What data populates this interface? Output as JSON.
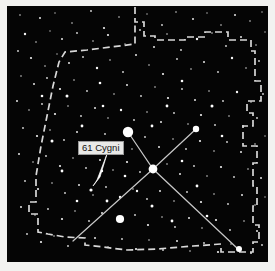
{
  "figure": {
    "caption": "",
    "background_color": "#f2f2f0",
    "sky_color": "#050505",
    "star_color": "#ffffff",
    "boundary_color": "#d8d8d8",
    "constellation_line_color": "#c8c8c8",
    "label_text_color": "#121212",
    "label_background_color": "#e9e9e7"
  },
  "labels": [
    {
      "id": "61-cygni",
      "text": "61 Cygni",
      "x": 71,
      "y": 135,
      "arrow": {
        "from_x": 100,
        "from_y": 148,
        "to_x": 86,
        "to_y": 180
      }
    }
  ],
  "chart_data": {
    "type": "scatter",
    "xlabel": "",
    "ylabel": "",
    "xlim": [
      0,
      261
    ],
    "ylim": [
      0,
      256
    ],
    "grid": false,
    "legend": null,
    "annotations": [
      "61 Cygni"
    ],
    "named_stars": [
      {
        "name": "Deneb",
        "x": 121,
        "y": 126,
        "magnitude_radius": 5.2
      },
      {
        "name": "Sadr",
        "x": 146,
        "y": 163,
        "magnitude_radius": 4.4
      },
      {
        "name": "Delta Cygni",
        "x": 189,
        "y": 123,
        "magnitude_radius": 3.2
      },
      {
        "name": "Epsilon Cygni",
        "x": 113,
        "y": 213,
        "magnitude_radius": 4.1
      },
      {
        "name": "Albireo",
        "x": 232,
        "y": 243,
        "magnitude_radius": 3.0
      },
      {
        "name": "61 Cygni",
        "x": 84,
        "y": 184,
        "magnitude_radius": 1.6
      }
    ],
    "constellation_lines": [
      {
        "name": "northern-cross-spine",
        "points": [
          [
            121,
            126
          ],
          [
            146,
            163
          ],
          [
            231,
            243
          ]
        ]
      },
      {
        "name": "northern-cross-crossbar",
        "points": [
          [
            189,
            123
          ],
          [
            146,
            163
          ],
          [
            66,
            235
          ]
        ]
      }
    ],
    "constellation_boundary": {
      "name": "Cygnus boundary",
      "style": "dashed",
      "points": [
        [
          128,
          1
        ],
        [
          128,
          16
        ],
        [
          137,
          16
        ],
        [
          137,
          30
        ],
        [
          148,
          30
        ],
        [
          148,
          34
        ],
        [
          178,
          34
        ],
        [
          178,
          31
        ],
        [
          198,
          31
        ],
        [
          198,
          26
        ],
        [
          221,
          26
        ],
        [
          221,
          34
        ],
        [
          244,
          34
        ],
        [
          244,
          45
        ],
        [
          248,
          45
        ],
        [
          248,
          75
        ],
        [
          254,
          75
        ],
        [
          254,
          95
        ],
        [
          240,
          95
        ],
        [
          240,
          107
        ],
        [
          246,
          107
        ],
        [
          246,
          120
        ],
        [
          236,
          120
        ],
        [
          236,
          140
        ],
        [
          250,
          140
        ],
        [
          250,
          157
        ],
        [
          246,
          157
        ],
        [
          246,
          180
        ],
        [
          250,
          180
        ],
        [
          250,
          200
        ],
        [
          246,
          200
        ],
        [
          246,
          219
        ],
        [
          252,
          219
        ],
        [
          252,
          236
        ],
        [
          246,
          236
        ],
        [
          246,
          246
        ],
        [
          214,
          246
        ],
        [
          214,
          238
        ],
        [
          186,
          240
        ],
        [
          150,
          243
        ],
        [
          120,
          244
        ],
        [
          96,
          241
        ],
        [
          78,
          239
        ],
        [
          78,
          232
        ],
        [
          58,
          231
        ],
        [
          41,
          228
        ],
        [
          31,
          226
        ],
        [
          31,
          208
        ],
        [
          22,
          208
        ],
        [
          22,
          196
        ],
        [
          29,
          196
        ],
        [
          29,
          170
        ],
        [
          34,
          140
        ],
        [
          40,
          110
        ],
        [
          46,
          80
        ],
        [
          52,
          56
        ],
        [
          58,
          46
        ],
        [
          80,
          44
        ],
        [
          104,
          41
        ],
        [
          128,
          38
        ],
        [
          128,
          16
        ]
      ]
    },
    "field_stars": [
      [
        13,
        9,
        0.8
      ],
      [
        33,
        12,
        1.0
      ],
      [
        48,
        7,
        0.7
      ],
      [
        65,
        17,
        0.8
      ],
      [
        84,
        5,
        0.9
      ],
      [
        97,
        22,
        1.1
      ],
      [
        112,
        11,
        0.8
      ],
      [
        140,
        8,
        0.7
      ],
      [
        155,
        19,
        0.9
      ],
      [
        169,
        6,
        0.8
      ],
      [
        186,
        13,
        1.0
      ],
      [
        200,
        7,
        0.7
      ],
      [
        214,
        19,
        0.8
      ],
      [
        228,
        9,
        1.0
      ],
      [
        243,
        15,
        0.8
      ],
      [
        255,
        6,
        0.7
      ],
      [
        18,
        28,
        1.2
      ],
      [
        29,
        36,
        0.8
      ],
      [
        43,
        25,
        0.7
      ],
      [
        55,
        33,
        1.0
      ],
      [
        70,
        27,
        0.9
      ],
      [
        86,
        35,
        0.8
      ],
      [
        101,
        29,
        1.1
      ],
      [
        118,
        38,
        0.7
      ],
      [
        133,
        24,
        0.9
      ],
      [
        147,
        41,
        1.0
      ],
      [
        160,
        28,
        0.8
      ],
      [
        174,
        44,
        0.9
      ],
      [
        190,
        33,
        1.2
      ],
      [
        205,
        27,
        0.8
      ],
      [
        219,
        40,
        0.9
      ],
      [
        234,
        31,
        1.0
      ],
      [
        249,
        39,
        0.8
      ],
      [
        258,
        26,
        0.7
      ],
      [
        11,
        45,
        0.9
      ],
      [
        24,
        52,
        1.1
      ],
      [
        38,
        60,
        0.8
      ],
      [
        50,
        48,
        0.7
      ],
      [
        62,
        57,
        1.0
      ],
      [
        76,
        51,
        0.9
      ],
      [
        90,
        62,
        1.2
      ],
      [
        103,
        54,
        0.8
      ],
      [
        116,
        66,
        0.9
      ],
      [
        129,
        49,
        1.0
      ],
      [
        142,
        59,
        0.8
      ],
      [
        156,
        68,
        1.1
      ],
      [
        170,
        53,
        0.9
      ],
      [
        184,
        63,
        0.8
      ],
      [
        197,
        56,
        1.0
      ],
      [
        211,
        66,
        0.9
      ],
      [
        225,
        52,
        1.2
      ],
      [
        239,
        62,
        0.8
      ],
      [
        252,
        55,
        0.9
      ],
      [
        14,
        70,
        0.8
      ],
      [
        27,
        78,
        1.0
      ],
      [
        40,
        72,
        0.9
      ],
      [
        53,
        83,
        1.1
      ],
      [
        67,
        74,
        0.8
      ],
      [
        80,
        85,
        0.9
      ],
      [
        93,
        77,
        1.3
      ],
      [
        107,
        88,
        0.8
      ],
      [
        120,
        79,
        1.0
      ],
      [
        134,
        90,
        0.9
      ],
      [
        148,
        81,
        0.8
      ],
      [
        161,
        92,
        1.1
      ],
      [
        175,
        83,
        0.9
      ],
      [
        188,
        94,
        1.0
      ],
      [
        202,
        85,
        0.8
      ],
      [
        216,
        95,
        0.9
      ],
      [
        230,
        86,
        1.2
      ],
      [
        244,
        96,
        0.8
      ],
      [
        256,
        88,
        0.9
      ],
      [
        10,
        95,
        1.0
      ],
      [
        22,
        104,
        0.8
      ],
      [
        35,
        98,
        0.9
      ],
      [
        48,
        108,
        1.1
      ],
      [
        61,
        100,
        0.8
      ],
      [
        74,
        110,
        0.9
      ],
      [
        88,
        102,
        1.0
      ],
      [
        101,
        112,
        0.8
      ],
      [
        114,
        104,
        1.2
      ],
      [
        127,
        114,
        0.9
      ],
      [
        140,
        106,
        0.8
      ],
      [
        154,
        116,
        1.0
      ],
      [
        167,
        107,
        0.9
      ],
      [
        181,
        118,
        0.8
      ],
      [
        194,
        109,
        1.1
      ],
      [
        208,
        119,
        0.9
      ],
      [
        222,
        110,
        0.8
      ],
      [
        236,
        120,
        1.0
      ],
      [
        250,
        112,
        0.9
      ],
      [
        16,
        122,
        0.9
      ],
      [
        30,
        130,
        1.1
      ],
      [
        43,
        124,
        0.8
      ],
      [
        57,
        134,
        0.9
      ],
      [
        70,
        126,
        1.0
      ],
      [
        84,
        136,
        0.8
      ],
      [
        98,
        128,
        0.9
      ],
      [
        111,
        138,
        1.2
      ],
      [
        125,
        143,
        0.8
      ],
      [
        138,
        131,
        0.9
      ],
      [
        152,
        141,
        1.0
      ],
      [
        166,
        133,
        0.8
      ],
      [
        179,
        143,
        0.9
      ],
      [
        193,
        135,
        1.1
      ],
      [
        207,
        145,
        0.8
      ],
      [
        220,
        136,
        0.9
      ],
      [
        234,
        146,
        1.0
      ],
      [
        248,
        138,
        0.8
      ],
      [
        258,
        130,
        0.7
      ],
      [
        12,
        148,
        1.0
      ],
      [
        26,
        156,
        0.8
      ],
      [
        39,
        150,
        0.9
      ],
      [
        53,
        160,
        1.1
      ],
      [
        66,
        152,
        0.8
      ],
      [
        79,
        162,
        0.9
      ],
      [
        93,
        154,
        1.0
      ],
      [
        106,
        164,
        0.8
      ],
      [
        120,
        156,
        1.1
      ],
      [
        133,
        166,
        0.9
      ],
      [
        160,
        158,
        0.8
      ],
      [
        173,
        168,
        1.0
      ],
      [
        187,
        160,
        0.9
      ],
      [
        200,
        170,
        0.8
      ],
      [
        214,
        161,
        1.1
      ],
      [
        227,
        171,
        0.9
      ],
      [
        241,
        163,
        0.8
      ],
      [
        254,
        172,
        1.0
      ],
      [
        18,
        175,
        0.9
      ],
      [
        31,
        183,
        1.1
      ],
      [
        45,
        177,
        0.8
      ],
      [
        58,
        187,
        0.9
      ],
      [
        72,
        179,
        1.0
      ],
      [
        86,
        189,
        0.8
      ],
      [
        99,
        181,
        0.9
      ],
      [
        113,
        191,
        1.2
      ],
      [
        126,
        183,
        0.8
      ],
      [
        140,
        193,
        0.9
      ],
      [
        153,
        185,
        1.0
      ],
      [
        167,
        195,
        0.8
      ],
      [
        180,
        186,
        0.9
      ],
      [
        194,
        196,
        1.1
      ],
      [
        207,
        188,
        0.8
      ],
      [
        221,
        198,
        0.9
      ],
      [
        235,
        189,
        1.0
      ],
      [
        248,
        199,
        0.8
      ],
      [
        258,
        191,
        0.7
      ],
      [
        14,
        201,
        1.0
      ],
      [
        28,
        209,
        0.8
      ],
      [
        41,
        203,
        0.9
      ],
      [
        55,
        213,
        1.1
      ],
      [
        68,
        205,
        0.8
      ],
      [
        82,
        215,
        0.9
      ],
      [
        95,
        207,
        1.0
      ],
      [
        128,
        209,
        0.9
      ],
      [
        141,
        219,
        1.1
      ],
      [
        155,
        211,
        0.8
      ],
      [
        168,
        221,
        0.9
      ],
      [
        182,
        212,
        1.0
      ],
      [
        195,
        222,
        0.8
      ],
      [
        209,
        214,
        1.1
      ],
      [
        223,
        224,
        0.9
      ],
      [
        237,
        215,
        0.8
      ],
      [
        250,
        225,
        1.0
      ],
      [
        20,
        228,
        0.9
      ],
      [
        34,
        236,
        1.1
      ],
      [
        47,
        230,
        0.8
      ],
      [
        61,
        240,
        0.9
      ],
      [
        88,
        232,
        1.0
      ],
      [
        101,
        241,
        0.8
      ],
      [
        115,
        233,
        0.9
      ],
      [
        129,
        243,
        1.1
      ],
      [
        142,
        234,
        0.8
      ],
      [
        156,
        244,
        0.9
      ],
      [
        170,
        235,
        1.0
      ],
      [
        183,
        245,
        0.8
      ],
      [
        197,
        237,
        0.9
      ],
      [
        211,
        246,
        1.1
      ],
      [
        224,
        238,
        0.8
      ],
      [
        244,
        247,
        1.0
      ],
      [
        255,
        239,
        0.9
      ],
      [
        60,
        90,
        1.5
      ],
      [
        75,
        120,
        1.4
      ],
      [
        96,
        100,
        1.3
      ],
      [
        160,
        100,
        1.4
      ],
      [
        175,
        75,
        1.3
      ],
      [
        205,
        100,
        1.5
      ],
      [
        55,
        165,
        1.4
      ],
      [
        70,
        195,
        1.3
      ],
      [
        100,
        195,
        1.4
      ],
      [
        145,
        200,
        1.5
      ],
      [
        175,
        155,
        1.3
      ],
      [
        190,
        180,
        1.4
      ],
      [
        215,
        130,
        1.3
      ],
      [
        45,
        135,
        1.5
      ],
      [
        35,
        90,
        1.3
      ],
      [
        145,
        120,
        1.4
      ],
      [
        118,
        170,
        1.3
      ],
      [
        130,
        185,
        1.2
      ],
      [
        165,
        215,
        1.4
      ],
      [
        200,
        210,
        1.3
      ],
      [
        95,
        165,
        1.2
      ],
      [
        83,
        145,
        1.1
      ]
    ]
  }
}
